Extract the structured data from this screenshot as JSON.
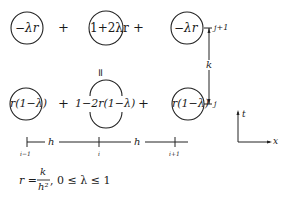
{
  "stencil": {
    "top_row": [
      {
        "label": "−λr",
        "circled": true
      },
      {
        "label": "1+2λr",
        "circled": true
      },
      {
        "label": "−λr",
        "circled": true
      }
    ],
    "top_ops": [
      "+",
      "+"
    ],
    "equals": "=",
    "bottom_row": [
      {
        "label": "r(1−λ)",
        "circled": true
      },
      {
        "label": "1−2r(1−λ)",
        "circled": "partial"
      },
      {
        "label": "r(1−λ)",
        "circled": true
      }
    ],
    "bottom_ops": [
      "+",
      "+"
    ]
  },
  "vertical_scale": {
    "top_label": "j+1",
    "bottom_label": "j",
    "step_label": "k"
  },
  "horizontal_scale": {
    "step_labels": [
      "h",
      "h"
    ],
    "tick_labels": [
      "i−1",
      "i",
      "i+1"
    ]
  },
  "axes": {
    "vertical": "t",
    "horizontal": "x"
  },
  "formula": {
    "lhs": "r =",
    "numerator": "k",
    "denominator": "h²",
    "condition": ",   0 ≤ λ ≤ 1"
  }
}
